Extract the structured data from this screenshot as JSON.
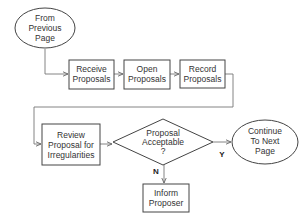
{
  "diagram": {
    "type": "flowchart",
    "colors": {
      "stroke": "#444444",
      "connector": "#777777",
      "text": "#333333",
      "background": "#ffffff"
    },
    "nodes": {
      "from_previous": {
        "shape": "ellipse",
        "lines": [
          "From",
          "Previous",
          "Page"
        ]
      },
      "receive": {
        "shape": "rectangle",
        "lines": [
          "Receive",
          "Proposals"
        ]
      },
      "open": {
        "shape": "rectangle",
        "lines": [
          "Open",
          "Proposals"
        ]
      },
      "record": {
        "shape": "rectangle",
        "lines": [
          "Record",
          "Proposals"
        ]
      },
      "review": {
        "shape": "rectangle",
        "lines": [
          "Review",
          "Proposal for",
          "Irregularities"
        ]
      },
      "decision": {
        "shape": "diamond",
        "lines": [
          "Proposal",
          "Acceptable",
          "?"
        ]
      },
      "continue": {
        "shape": "ellipse",
        "lines": [
          "Continue",
          "To Next",
          "Page"
        ]
      },
      "inform": {
        "shape": "rectangle",
        "lines": [
          "Inform",
          "Proposer"
        ]
      }
    },
    "edges": [
      {
        "from": "from_previous",
        "to": "receive",
        "label": ""
      },
      {
        "from": "receive",
        "to": "open",
        "label": ""
      },
      {
        "from": "open",
        "to": "record",
        "label": ""
      },
      {
        "from": "record",
        "to": "review",
        "label": ""
      },
      {
        "from": "review",
        "to": "decision",
        "label": ""
      },
      {
        "from": "decision",
        "to": "continue",
        "label": "Y"
      },
      {
        "from": "decision",
        "to": "inform",
        "label": "N"
      }
    ],
    "edge_labels": {
      "yes": "Y",
      "no": "N"
    }
  }
}
